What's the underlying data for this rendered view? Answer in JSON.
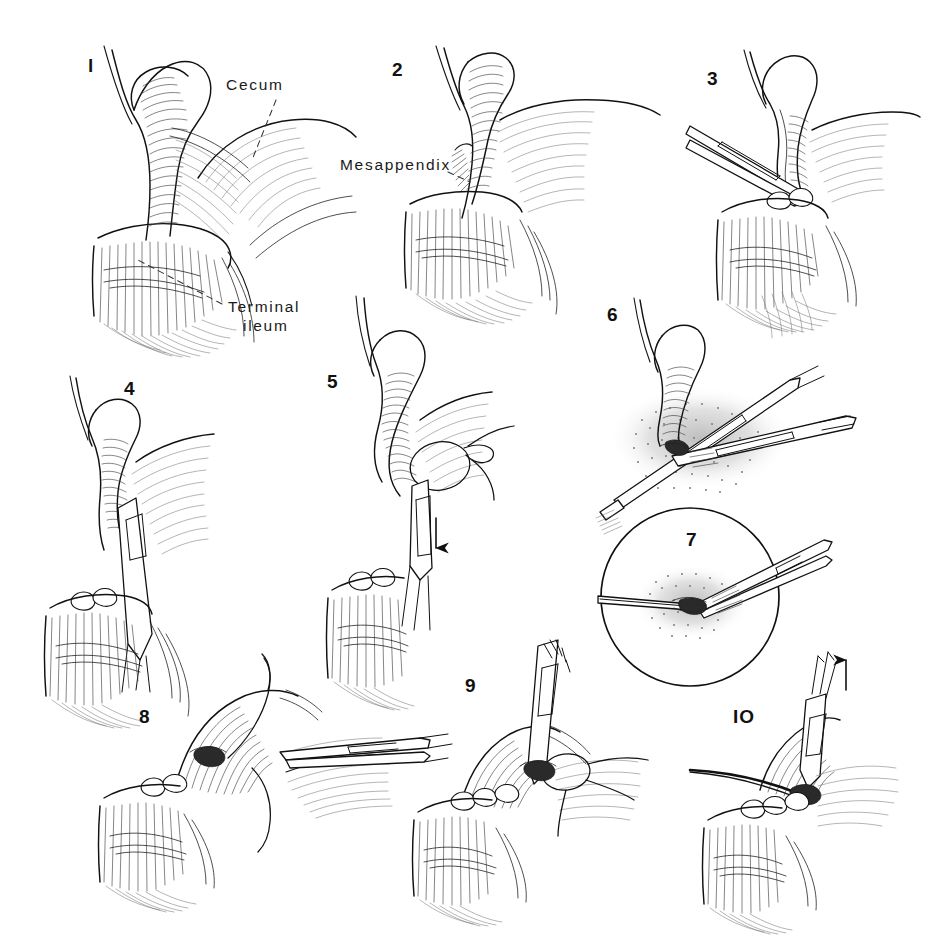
{
  "plate": {
    "kind": "medical-line-illustration",
    "subject": "Appendectomy — step-by-step surgical technique",
    "style": "pen-and-ink line drawing, black on white",
    "background_color": "#ffffff",
    "ink_color": "#111111",
    "width": 925,
    "height": 942,
    "panel_count": 10
  },
  "panels": [
    {
      "number": "l",
      "number_display": "1",
      "x": 88,
      "y": 72,
      "caption_labels": [
        "Cecum",
        "Terminal ileum"
      ],
      "depicts": "appendix elevated, cecum and terminal ileum exposed"
    },
    {
      "number": "2",
      "number_display": "2",
      "x": 392,
      "y": 76,
      "caption_labels": [
        "Mesappendix"
      ],
      "depicts": "mesappendix identified beneath the appendix"
    },
    {
      "number": "3",
      "number_display": "3",
      "x": 707,
      "y": 85,
      "caption_labels": [],
      "depicts": "hemostat passed through the avascular mesappendix"
    },
    {
      "number": "4",
      "number_display": "4",
      "x": 124,
      "y": 395,
      "caption_labels": [],
      "depicts": "clamp applied vertically across the mesappendix"
    },
    {
      "number": "5",
      "number_display": "5",
      "x": 327,
      "y": 388,
      "caption_labels": [],
      "depicts": "mesappendix ligated, clamp withdrawn downward"
    },
    {
      "number": "6",
      "number_display": "6",
      "x": 607,
      "y": 321,
      "caption_labels": [],
      "depicts": "base of appendix crushed and ligated with clamps"
    },
    {
      "number": "7",
      "number_display": "7",
      "x": 686,
      "y": 546,
      "caption_labels": [],
      "depicts": "magnified circular inset of the ligated appendiceal base"
    },
    {
      "number": "8",
      "number_display": "8",
      "x": 139,
      "y": 723,
      "caption_labels": [],
      "depicts": "appendix amputated, purse-string suture placed in cecum"
    },
    {
      "number": "9",
      "number_display": "9",
      "x": 465,
      "y": 692,
      "caption_labels": [],
      "depicts": "stump inverted into cecum with forceps"
    },
    {
      "number": "IO",
      "number_display": "10",
      "x": 733,
      "y": 723,
      "caption_labels": [],
      "depicts": "purse-string drawn tight, forceps withdrawn upward"
    }
  ],
  "labels": [
    {
      "id": "cecum",
      "text": "Cecum",
      "x": 226,
      "y": 90,
      "align": "start"
    },
    {
      "id": "terminal-ileum-line1",
      "text": "Terminal",
      "x": 228,
      "y": 312,
      "align": "start"
    },
    {
      "id": "terminal-ileum-line2",
      "text": "ileum",
      "x": 243,
      "y": 331,
      "align": "start"
    },
    {
      "id": "mesappendix",
      "text": "Mesappendix",
      "x": 340,
      "y": 170,
      "align": "start"
    }
  ],
  "arrows": [
    {
      "id": "panel5-down-arrow",
      "panel": "5",
      "direction": "down",
      "x": 432,
      "y": 530
    },
    {
      "id": "panel10-up-arrow",
      "panel": "10",
      "direction": "up",
      "x": 840,
      "y": 660
    }
  ],
  "inset": {
    "id": "panel7-circle",
    "shape": "circle",
    "cx": 690,
    "cy": 597,
    "r": 89
  }
}
